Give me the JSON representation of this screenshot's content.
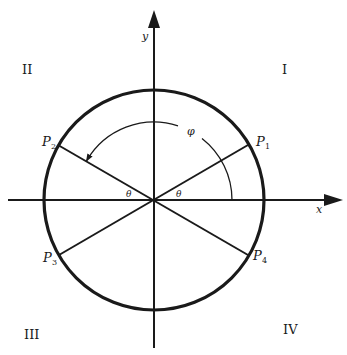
{
  "axes": {
    "x_label": "x",
    "y_label": "y"
  },
  "quadrants": {
    "q1": "I",
    "q2": "II",
    "q3": "III",
    "q4": "IV"
  },
  "points": {
    "p1": {
      "letter": "P",
      "sub": "1"
    },
    "p2": {
      "letter": "P",
      "sub": "2"
    },
    "p3": {
      "letter": "P",
      "sub": "3"
    },
    "p4": {
      "letter": "P",
      "sub": "4"
    }
  },
  "angles": {
    "theta_right": "θ",
    "theta_left": "θ",
    "phi": "φ"
  },
  "colors": {
    "stroke": "#1a1a1a",
    "background": "#ffffff"
  }
}
